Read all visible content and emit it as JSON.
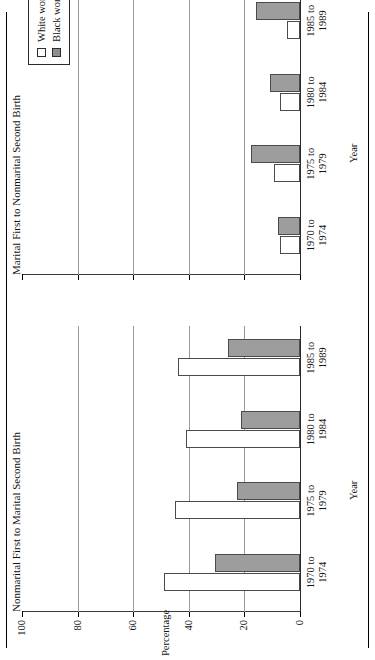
{
  "chart_data": {
    "type": "bar",
    "orientation": "horizontal-grouped-two-panel",
    "title": "",
    "xlabel": "Year",
    "ylabel": "Percentage",
    "ylim": [
      0,
      100
    ],
    "yticks": [
      0,
      20,
      40,
      60,
      80,
      100
    ],
    "ytick_labels": [
      "0",
      "20",
      "40",
      "60",
      "80",
      "100"
    ],
    "grid": "value-axis gridlines at 20, 40, 60, 80",
    "legend": {
      "position": "upper-right-of-second-panel",
      "entries": [
        {
          "label": "White women",
          "swatch": "white"
        },
        {
          "label": "Black women",
          "swatch": "black"
        }
      ]
    },
    "categories": [
      "1970 to 1974",
      "1975 to 1979",
      "1980 to 1984",
      "1985 to 1989"
    ],
    "category_lines": [
      [
        "1970 to",
        "1974"
      ],
      [
        "1975 to",
        "1979"
      ],
      [
        "1980 to",
        "1984"
      ],
      [
        "1985 to",
        "1989"
      ]
    ],
    "panels": [
      {
        "id": "panel-nonmarital-first",
        "title": "Nonmarital First to Marital Second Birth",
        "xlabel": "Year",
        "series": [
          {
            "name": "White women",
            "values": [
              48.8,
              45.0,
              41.0,
              43.8
            ]
          },
          {
            "name": "Black women",
            "values": [
              30.6,
              22.8,
              21.3,
              25.8
            ]
          }
        ]
      },
      {
        "id": "panel-marital-first",
        "title": "Marital First to Nonmarital Second Birth",
        "xlabel": "Year",
        "series": [
          {
            "name": "White women",
            "values": [
              7.1,
              9.4,
              7.1,
              4.7
            ]
          },
          {
            "name": "Black women",
            "values": [
              7.8,
              17.7,
              10.7,
              15.8
            ]
          }
        ]
      }
    ],
    "colors": {
      "white_women": "#ffffff",
      "black_women": "#9d9d9d",
      "axis": "#2b2b2b",
      "gridline": "#9a9a9a"
    }
  }
}
